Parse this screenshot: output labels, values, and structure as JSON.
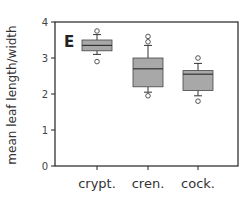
{
  "panel_label": "E",
  "chart_data": {
    "type": "box",
    "title": "",
    "panel": "E",
    "xlabel": "",
    "ylabel": "mean leaf length/width",
    "ylim": [
      0,
      4
    ],
    "yticks": [
      "0",
      "1",
      "2",
      "3",
      "4"
    ],
    "categories": [
      "crypt.",
      "cren.",
      "cock."
    ],
    "boxes": [
      {
        "name": "crypt.",
        "whisker_low": 3.1,
        "q1": 3.2,
        "median": 3.35,
        "q3": 3.5,
        "whisker_high": 3.65,
        "outliers": [
          2.9,
          3.75
        ]
      },
      {
        "name": "cren.",
        "whisker_low": 2.05,
        "q1": 2.2,
        "median": 2.7,
        "q3": 3.0,
        "whisker_high": 3.35,
        "outliers": [
          1.95,
          3.45,
          3.6
        ]
      },
      {
        "name": "cock.",
        "whisker_low": 1.95,
        "q1": 2.1,
        "median": 2.55,
        "q3": 2.65,
        "whisker_high": 2.85,
        "outliers": [
          1.8,
          3.0
        ]
      }
    ],
    "box_color": "#a8a8a8",
    "grid": false
  }
}
